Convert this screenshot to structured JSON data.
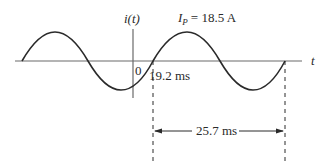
{
  "diagram": {
    "type": "sinusoidal-waveform",
    "axes": {
      "y_label": "i(t)",
      "x_label": "t",
      "origin_label": "0"
    },
    "annotations": {
      "peak_current_symbol": "I",
      "peak_current_subscript": "P",
      "peak_current_value": "= 18.5 A",
      "zero_crossing_label": "19.2 ms",
      "period_label": "25.7 ms"
    },
    "colors": {
      "line": "#2a2a2a",
      "axis": "#6a6a6a",
      "background": "#ffffff"
    }
  }
}
